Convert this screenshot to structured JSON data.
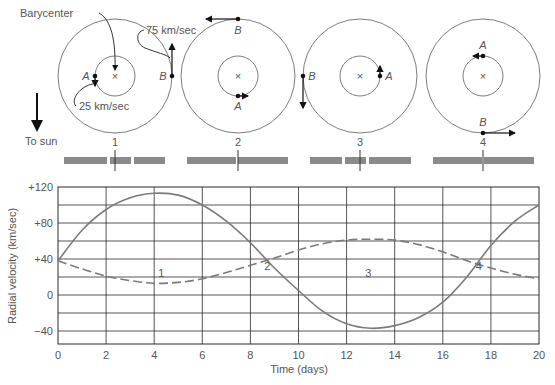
{
  "figure": {
    "barycenter_label": "Barycenter",
    "speed_b_label": "75 km/sec",
    "speed_a_label": "25 km/sec",
    "to_sun_label": "To sun",
    "star_a_label": "A",
    "star_b_label": "B",
    "barycenter_mark": "×",
    "phases": [
      {
        "label": "1",
        "a_pos": "left",
        "a_dir": "down",
        "b_pos": "right",
        "b_dir": "up"
      },
      {
        "label": "2",
        "a_pos": "bottom",
        "a_dir": "right",
        "b_pos": "top",
        "b_dir": "left"
      },
      {
        "label": "3",
        "a_pos": "right",
        "a_dir": "up",
        "b_pos": "left",
        "b_dir": "down"
      },
      {
        "label": "4",
        "a_pos": "top",
        "a_dir": "left",
        "b_pos": "bottom",
        "b_dir": "right"
      }
    ],
    "colors": {
      "line": "#6e6e6e",
      "curve": "#7a7a7a",
      "grid": "#2b2b2b",
      "spectrum": "#8a8a8a",
      "text": "#555555",
      "arrow": "#111111"
    }
  },
  "chart_data": {
    "type": "line",
    "title": "",
    "xlabel": "Time (days)",
    "ylabel": "Radial velocity  (km/sec)",
    "xlim": [
      0,
      20
    ],
    "ylim": [
      -55,
      120
    ],
    "grid": true,
    "x_ticks": [
      "0",
      "2",
      "4",
      "6",
      "8",
      "10",
      "12",
      "14",
      "16",
      "18",
      "20"
    ],
    "y_ticks": [
      "+120",
      "+80",
      "+40",
      "0",
      "−40"
    ],
    "annotations": [
      {
        "text": "1",
        "x": 4.3,
        "y": 25
      },
      {
        "text": "2",
        "x": 8.7,
        "y": 32
      },
      {
        "text": "3",
        "x": 12.9,
        "y": 25
      },
      {
        "text": "4",
        "x": 17.5,
        "y": 32
      }
    ],
    "x": [
      0,
      1,
      2,
      3,
      4,
      5,
      6,
      7,
      8,
      9,
      10,
      11,
      12,
      13,
      14,
      15,
      16,
      17,
      18,
      19,
      20
    ],
    "series": [
      {
        "name": "Star B (solid)",
        "style": "solid",
        "values": [
          38,
          72,
          95,
          108,
          113,
          111,
          100,
          82,
          58,
          30,
          5,
          -18,
          -32,
          -37,
          -34,
          -25,
          -8,
          20,
          55,
          82,
          100
        ]
      },
      {
        "name": "Star A (dashed)",
        "style": "dashed",
        "values": [
          38,
          29,
          21,
          16,
          13,
          14,
          18,
          25,
          33,
          41,
          50,
          57,
          61,
          62,
          61,
          56,
          48,
          38,
          30,
          23,
          18
        ]
      }
    ]
  }
}
